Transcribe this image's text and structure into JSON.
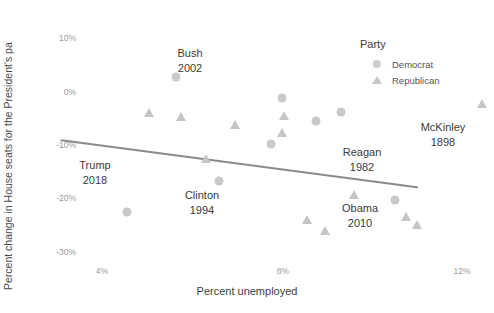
{
  "chart_data": {
    "type": "scatter",
    "title": "",
    "xlabel": "Percent unemployed",
    "ylabel": "Percent change in House seats for the President's pa",
    "xlim": [
      2.55,
      12.9
    ],
    "ylim": [
      -34.5,
      13.5
    ],
    "xticks": [
      "4%",
      "8%",
      "12%"
    ],
    "xtickvalues": [
      4,
      8,
      12
    ],
    "yticks": [
      "10%",
      "0%",
      "-10%",
      "-20%",
      "-30%"
    ],
    "ytickvalues": [
      10,
      0,
      -10,
      -20,
      -30
    ],
    "grid": false,
    "legend": {
      "title": "Party",
      "position": "top-right",
      "entries": [
        {
          "label": "Democrat",
          "marker": "circle",
          "color": "#cdcdcd"
        },
        {
          "label": "Republican",
          "marker": "triangle",
          "color": "#c8c8c8"
        }
      ]
    },
    "series": [
      {
        "name": "Democrat",
        "marker": "circle",
        "color": "#c9c9c9",
        "points": [
          {
            "x": 5.65,
            "y": 2.7
          },
          {
            "x": 8.0,
            "y": -1.2
          },
          {
            "x": 9.3,
            "y": -3.9
          },
          {
            "x": 8.75,
            "y": -5.6
          },
          {
            "x": 7.75,
            "y": -9.9
          },
          {
            "x": 6.6,
            "y": -16.8
          },
          {
            "x": 10.5,
            "y": -20.2
          },
          {
            "x": 4.55,
            "y": -22.5
          }
        ]
      },
      {
        "name": "Republican",
        "marker": "triangle",
        "color": "#c5c5c5",
        "points": [
          {
            "x": 12.45,
            "y": -2.4
          },
          {
            "x": 5.05,
            "y": -4.0
          },
          {
            "x": 5.75,
            "y": -4.7
          },
          {
            "x": 8.05,
            "y": -4.6
          },
          {
            "x": 6.95,
            "y": -6.3
          },
          {
            "x": 8.0,
            "y": -7.7
          },
          {
            "x": 6.3,
            "y": -12.6
          },
          {
            "x": 9.6,
            "y": -19.3
          },
          {
            "x": 8.55,
            "y": -24.0
          },
          {
            "x": 10.75,
            "y": -23.5
          },
          {
            "x": 11.0,
            "y": -25.0
          },
          {
            "x": 8.95,
            "y": -26.0
          }
        ]
      }
    ],
    "trendline": {
      "x_start": 3.1,
      "y_start": -9.1,
      "x_end": 11.0,
      "y_end": -17.9,
      "color": "#8a8a8a",
      "width": 2
    },
    "annotations": [
      {
        "name": "Bush",
        "year": "2002",
        "x": 8.0,
        "y": 8.6,
        "px": 190,
        "py": 46
      },
      {
        "name": "Trump",
        "year": "2018",
        "x": 4.1,
        "y": -12.3,
        "px": 95,
        "py": 158
      },
      {
        "name": "Clinton",
        "year": "1994",
        "x": 8.6,
        "y": -18.3,
        "px": 202,
        "py": 188
      },
      {
        "name": "Reagan",
        "year": "1982",
        "x": 11.1,
        "y": -9.0,
        "px": 362,
        "py": 145
      },
      {
        "name": "McKinley",
        "year": "1898",
        "x": 12.35,
        "y": -5.2,
        "px": 443,
        "py": 120
      },
      {
        "name": "Obama",
        "year": "2010",
        "x": 10.1,
        "y": -20.4,
        "px": 360,
        "py": 201
      }
    ]
  }
}
